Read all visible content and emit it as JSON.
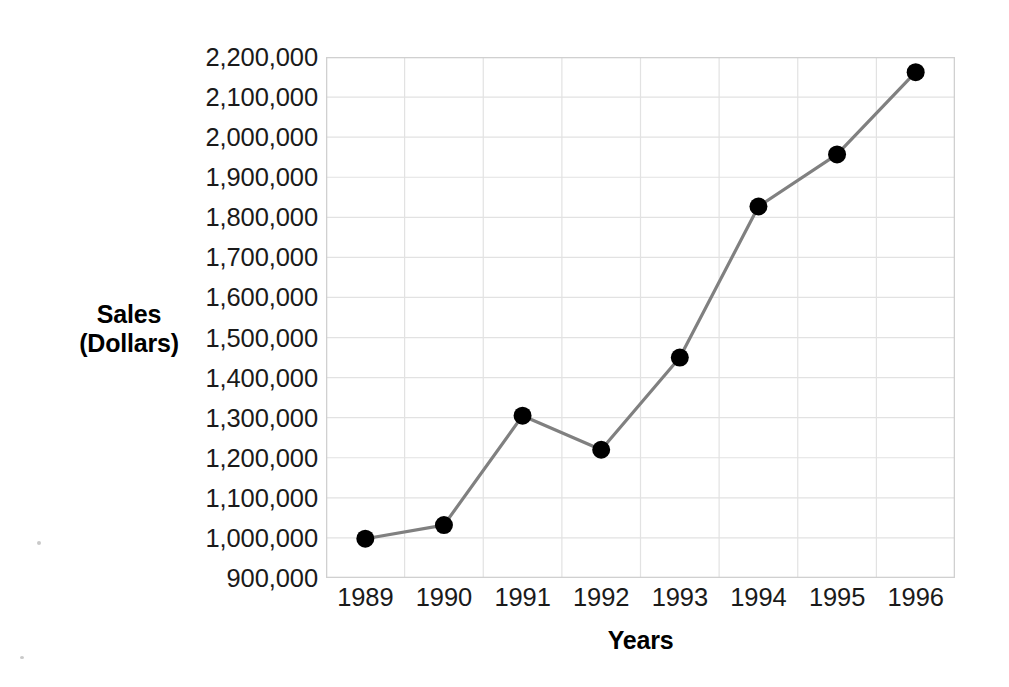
{
  "chart_data": {
    "type": "line",
    "title": "",
    "xlabel": "Years",
    "ylabel": "Sales\n(Dollars)",
    "ylabel_lines": [
      "Sales",
      "(Dollars)"
    ],
    "categories": [
      "1989",
      "1990",
      "1991",
      "1992",
      "1993",
      "1994",
      "1995",
      "1996"
    ],
    "x": [
      1989,
      1990,
      1991,
      1992,
      1993,
      1994,
      1995,
      1996
    ],
    "values": [
      998000,
      1032000,
      1305000,
      1220000,
      1450000,
      1827000,
      1957000,
      2162000
    ],
    "point_labels": [
      "998,000",
      "1,032,000",
      "1,305,000",
      "1,220,000",
      "1,450,000",
      "1,827,000",
      "1,957,000",
      "2,162,000"
    ],
    "ylim": [
      900000,
      2200000
    ],
    "ytick_values": [
      900000,
      1000000,
      1100000,
      1200000,
      1300000,
      1400000,
      1500000,
      1600000,
      1700000,
      1800000,
      1900000,
      2000000,
      2100000,
      2200000
    ],
    "ytick_labels": [
      "900,000",
      "1,000,000",
      "1,100,000",
      "1,200,000",
      "1,300,000",
      "1,400,000",
      "1,500,000",
      "1,600,000",
      "1,700,000",
      "1,800,000",
      "1,900,000",
      "2,000,000",
      "2,100,000",
      "2,200,000"
    ],
    "ytick_step": 100000,
    "grid": true,
    "grid_axes": "both",
    "legend": null,
    "legend_position": "none",
    "annotations": [],
    "marker": "filled-circle",
    "colors": {
      "line": "#808080",
      "marker": "#000000",
      "grid": "#e2e2e2",
      "axis_frame": "#d0d0d0",
      "text": "#1a1a1a",
      "title_text": "#000000",
      "background": "#ffffff"
    }
  }
}
